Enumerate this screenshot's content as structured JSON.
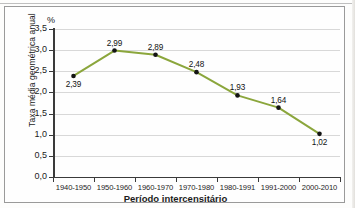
{
  "chart_data": {
    "type": "line",
    "title": "",
    "xlabel": "Período intercensitário",
    "ylabel": "Taxa média geométrica anual",
    "unit_label": "%",
    "categories": [
      "1940-1950",
      "1950-1960",
      "1960-1970",
      "1970-1980",
      "1980-1991",
      "1991-2000",
      "2000-2010"
    ],
    "values": [
      2.39,
      2.99,
      2.89,
      2.48,
      1.93,
      1.64,
      1.02
    ],
    "point_labels": [
      "2,39",
      "2,99",
      "2,89",
      "2,48",
      "1,93",
      "1,64",
      "1,02"
    ],
    "label_positions": [
      "below",
      "above",
      "above",
      "above",
      "above",
      "above",
      "below"
    ],
    "ylim": [
      0,
      3.5
    ],
    "ytick_labels": [
      "0,0",
      "0,5",
      "1,0",
      "1,5",
      "2,0",
      "2,5",
      "3,0",
      "3,5"
    ],
    "ytick_values": [
      0,
      0.5,
      1.0,
      1.5,
      2.0,
      2.5,
      3.0,
      3.5
    ],
    "grid": true,
    "legend": "none",
    "line_color": "#8ba63c",
    "marker_color": "#141414",
    "gridline_color": "#d8d8d8",
    "axis_color": "#3a3a3a"
  }
}
